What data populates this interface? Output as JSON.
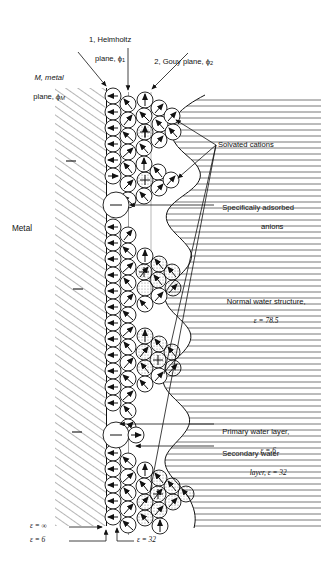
{
  "figure": {
    "type": "electrochemical-double-layer-diagram",
    "title_visible": false
  },
  "labels": {
    "helmholtz_plane_line1": "1, Helmholtz",
    "helmholtz_plane_line2": "plane, ϕ",
    "helmholtz_plane_sub": "1",
    "gouy_plane": "2, Gouy plane, ϕ",
    "gouy_plane_sub": "2",
    "metal_plane_line1": "M, metal",
    "metal_plane_line2": "plane, ϕ",
    "metal_plane_sub": "M",
    "metal": "Metal",
    "solvated_cations": "Solvated cations",
    "specifically_adsorbed_line1": "Specifically adsorbed",
    "specifically_adsorbed_line2": "anions",
    "normal_water_line1": "Normal water structure,",
    "normal_water_line2": "ε = 78.5",
    "primary_water_line1": "Primary water layer,",
    "primary_water_line2": "ε = 6",
    "secondary_water_line1": "Secondary water",
    "secondary_water_line2": "layer, ε = 32",
    "eps_infinity": "ε = ∞",
    "eps_six": "ε = 6",
    "eps_thirtytwo": "ε = 32"
  },
  "values": {
    "bulk_permittivity": "78.5",
    "primary_layer_permittivity": "6",
    "secondary_layer_permittivity": "32",
    "metal_permittivity": "∞"
  },
  "colors": {
    "ink": "#111111",
    "hatch": "#555555",
    "background": "#ffffff"
  }
}
